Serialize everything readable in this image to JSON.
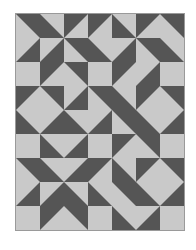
{
  "pattern": {
    "name": "half-square triangle quilt",
    "columns": 7,
    "rows": 9,
    "colors": {
      "dark": "#555555",
      "light": "#c9c9c9",
      "seam": "#8c8c8c"
    },
    "legend": {
      "TL": "dark top-left half",
      "TR": "dark top-right half",
      "BL": "dark bottom-left half",
      "BR": "dark bottom-right half",
      "L": "solid light square"
    },
    "grid": [
      [
        "TR",
        "BL",
        "TL",
        "TL",
        "BL",
        "TL",
        "TR"
      ],
      [
        "BR",
        "BR",
        "TR",
        "BL",
        "BR",
        "TR",
        "BL"
      ],
      [
        "L",
        "TL",
        "TR",
        "L",
        "TL",
        "BR",
        "L"
      ],
      [
        "TL",
        "TR",
        "BR",
        "TR",
        "BL",
        "TL",
        "TR"
      ],
      [
        "BL",
        "BR",
        "BL",
        "BR",
        "TR",
        "BL",
        "BR"
      ],
      [
        "L",
        "BL",
        "BR",
        "L",
        "TL",
        "TR",
        "L"
      ],
      [
        "TR",
        "BL",
        "BR",
        "TL",
        "BL",
        "TL",
        "TR"
      ],
      [
        "BR",
        "BR",
        "BL",
        "BL",
        "TR",
        "BL",
        "BR"
      ],
      [
        "L",
        "TL",
        "TR",
        "L",
        "BL",
        "BR",
        "L"
      ]
    ]
  }
}
